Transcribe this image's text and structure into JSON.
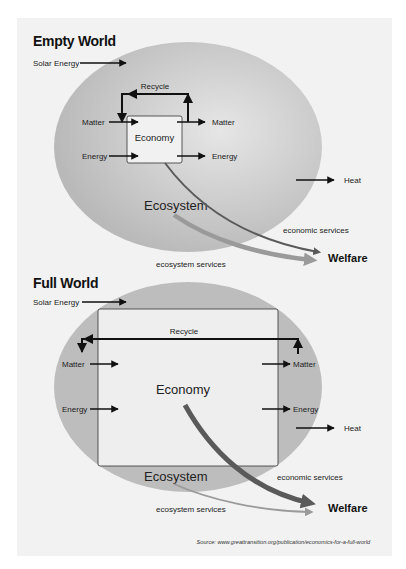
{
  "empty_world": {
    "title": "Empty World",
    "solar_energy": "Solar Energy",
    "recycle": "Recycle",
    "matter_in": "Matter",
    "matter_out": "Matter",
    "energy_in": "Energy",
    "energy_out": "Energy",
    "economy": "Economy",
    "ecosystem": "Ecosystem",
    "heat": "Heat",
    "economic_services": "economic services",
    "ecosystem_services": "ecosystem services",
    "welfare": "Welfare"
  },
  "full_world": {
    "title": "Full World",
    "solar_energy": "Solar Energy",
    "recycle": "Recycle",
    "matter_in": "Matter",
    "matter_out": "Matter",
    "energy_in": "Energy",
    "energy_out": "Energy",
    "economy": "Economy",
    "ecosystem": "Ecosystem",
    "heat": "Heat",
    "economic_services": "economic services",
    "ecosystem_services": "ecosystem services",
    "welfare": "Welfare"
  },
  "source": "Source: www.greattransition.org/publication/economics-for-a-full-world",
  "colors": {
    "panel_bg": "#f2f2f2",
    "ellipse_edge": "#b8b8b8",
    "ellipse_center": "#e2e2e2",
    "economic_arrow": "#5a5a5a",
    "ecosystem_arrow": "#9a9a9a"
  }
}
